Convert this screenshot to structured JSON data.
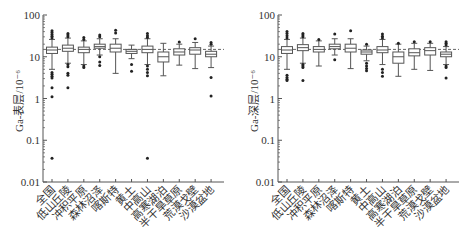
{
  "chart_data": [
    {
      "type": "box",
      "title": "",
      "xlabel": "",
      "ylabel": "Ga-表层/10⁻⁶",
      "yscale": "log",
      "ylim": [
        0.01,
        100
      ],
      "yticks": [
        "0.01",
        "0.1",
        "1",
        "10",
        "100"
      ],
      "reference_line": {
        "value": 15,
        "style": "dashed"
      },
      "categories": [
        "全国",
        "低山丘陵",
        "冲积平原",
        "森林沼泽",
        "喀斯特",
        "黄土",
        "中高山",
        "高寒湖泊",
        "半干旱草原",
        "荒漠戈壁",
        "沙漠盆地"
      ],
      "boxes": [
        {
          "q1": 12,
          "median": 14.5,
          "q3": 17,
          "whisker_low": 5,
          "whisker_high": 26,
          "outliers": [
            28,
            31,
            34,
            38,
            42,
            4.2,
            3.8,
            3.4,
            3.1,
            1.8,
            1.1,
            0.037
          ]
        },
        {
          "q1": 13.5,
          "median": 16,
          "q3": 19,
          "whisker_low": 7,
          "whisker_high": 28,
          "outliers": [
            30,
            33,
            36,
            6.5,
            5.8,
            4.0,
            3.6,
            1.8
          ]
        },
        {
          "q1": 12.5,
          "median": 15,
          "q3": 17,
          "whisker_low": 6.5,
          "whisker_high": 24,
          "outliers": [
            26,
            29,
            6.0,
            5.5
          ]
        },
        {
          "q1": 16,
          "median": 17.5,
          "q3": 20,
          "whisker_low": 11,
          "whisker_high": 27,
          "outliers": [
            30,
            33,
            10,
            7.5,
            6.2
          ]
        },
        {
          "q1": 13,
          "median": 16,
          "q3": 20,
          "whisker_low": 4.0,
          "whisker_high": 27,
          "outliers": [
            37,
            43
          ]
        },
        {
          "q1": 12,
          "median": 13.5,
          "q3": 15,
          "whisker_low": 9,
          "whisker_high": 19,
          "outliers": [
            6.5,
            4.5
          ]
        },
        {
          "q1": 12.5,
          "median": 15,
          "q3": 18,
          "whisker_low": 6.5,
          "whisker_high": 27,
          "outliers": [
            29,
            32,
            36,
            6.0,
            5.0,
            4.2,
            3.5,
            0.037
          ]
        },
        {
          "q1": 7.5,
          "median": 10,
          "q3": 13,
          "whisker_low": 3.5,
          "whisker_high": 21,
          "outliers": []
        },
        {
          "q1": 11,
          "median": 13,
          "q3": 15.5,
          "whisker_low": 6.3,
          "whisker_high": 20,
          "outliers": [
            22.5
          ]
        },
        {
          "q1": 11.5,
          "median": 14.5,
          "q3": 16.5,
          "whisker_low": 5.2,
          "whisker_high": 22,
          "outliers": [
            27
          ]
        },
        {
          "q1": 10,
          "median": 11.5,
          "q3": 13.5,
          "whisker_low": 5.5,
          "whisker_high": 18,
          "outliers": [
            20,
            22,
            3.2,
            1.15
          ]
        }
      ]
    },
    {
      "type": "box",
      "title": "",
      "xlabel": "",
      "ylabel": "Ga-深层/10⁻⁶",
      "yscale": "log",
      "ylim": [
        0.01,
        100
      ],
      "yticks": [
        "0.01",
        "0.1",
        "1",
        "10",
        "100"
      ],
      "reference_line": {
        "value": 15,
        "style": "dashed"
      },
      "categories": [
        "全国",
        "低山丘陵",
        "冲积平原",
        "森林沼泽",
        "喀斯特",
        "黄土",
        "中高山",
        "高寒湖泊",
        "半干旱草原",
        "荒漠戈壁",
        "沙漠盆地"
      ],
      "boxes": [
        {
          "q1": 12,
          "median": 14.5,
          "q3": 17.5,
          "whisker_low": 5,
          "whisker_high": 26,
          "outliers": [
            28,
            32,
            36,
            40,
            3.6,
            3.2,
            2.9,
            2.7
          ]
        },
        {
          "q1": 14,
          "median": 16.5,
          "q3": 19.5,
          "whisker_low": 7,
          "whisker_high": 28,
          "outliers": [
            30,
            33,
            36,
            6.5,
            6.0,
            5.5,
            2.7
          ]
        },
        {
          "q1": 13,
          "median": 15,
          "q3": 17.5,
          "whisker_low": 6,
          "whisker_high": 24,
          "outliers": [
            26
          ]
        },
        {
          "q1": 15.5,
          "median": 17.5,
          "q3": 20,
          "whisker_low": 11,
          "whisker_high": 27,
          "outliers": [
            35,
            8.5
          ]
        },
        {
          "q1": 13,
          "median": 16,
          "q3": 20,
          "whisker_low": 5.2,
          "whisker_high": 27,
          "outliers": [
            42
          ]
        },
        {
          "q1": 11.5,
          "median": 13,
          "q3": 14.5,
          "whisker_low": 8,
          "whisker_high": 18,
          "outliers": [
            20,
            7.0,
            6.0,
            5.2,
            4.6
          ]
        },
        {
          "q1": 12.5,
          "median": 14.5,
          "q3": 17.5,
          "whisker_low": 6.5,
          "whisker_high": 26,
          "outliers": [
            28,
            31,
            35,
            5.0,
            4.2,
            3.4
          ]
        },
        {
          "q1": 7,
          "median": 10,
          "q3": 13,
          "whisker_low": 3.4,
          "whisker_high": 20,
          "outliers": [
            21
          ]
        },
        {
          "q1": 10.5,
          "median": 12.5,
          "q3": 15.5,
          "whisker_low": 5,
          "whisker_high": 21,
          "outliers": [
            23
          ]
        },
        {
          "q1": 11,
          "median": 14,
          "q3": 16.5,
          "whisker_low": 4.7,
          "whisker_high": 21,
          "outliers": [
            23
          ]
        },
        {
          "q1": 10,
          "median": 11.5,
          "q3": 13,
          "whisker_low": 6.5,
          "whisker_high": 17.5,
          "outliers": [
            19,
            21,
            23,
            6.0,
            5.5,
            3.1
          ]
        }
      ]
    }
  ]
}
